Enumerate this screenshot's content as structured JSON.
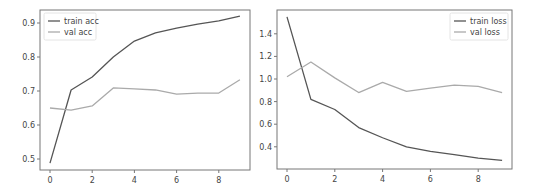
{
  "chart_data": [
    {
      "type": "line",
      "title": "",
      "xlabel": "",
      "ylabel": "",
      "x": [
        0,
        1,
        2,
        3,
        4,
        5,
        6,
        7,
        8,
        9
      ],
      "xticks": [
        "0",
        "2",
        "4",
        "6",
        "8"
      ],
      "yticks": [
        "0.5",
        "0.6",
        "0.7",
        "0.8",
        "0.9"
      ],
      "ylim": [
        0.47,
        0.94
      ],
      "grid": false,
      "legend_position": "upper left",
      "series": [
        {
          "name": "train acc",
          "color": "#555555",
          "values": [
            0.488,
            0.703,
            0.741,
            0.8,
            0.847,
            0.871,
            0.885,
            0.897,
            0.906,
            0.92
          ]
        },
        {
          "name": "val acc",
          "color": "#aaaaaa",
          "values": [
            0.65,
            0.644,
            0.656,
            0.709,
            0.706,
            0.703,
            0.691,
            0.694,
            0.694,
            0.733
          ]
        }
      ]
    },
    {
      "type": "line",
      "title": "",
      "xlabel": "",
      "ylabel": "",
      "x": [
        0,
        1,
        2,
        3,
        4,
        5,
        6,
        7,
        8,
        9
      ],
      "xticks": [
        "0",
        "2",
        "4",
        "6",
        "8"
      ],
      "yticks": [
        "0.4",
        "0.6",
        "0.8",
        "1.0",
        "1.2",
        "1.4"
      ],
      "ylim": [
        0.22,
        1.6
      ],
      "grid": false,
      "legend_position": "upper right",
      "series": [
        {
          "name": "train loss",
          "color": "#555555",
          "values": [
            1.55,
            0.82,
            0.73,
            0.57,
            0.48,
            0.4,
            0.36,
            0.33,
            0.3,
            0.28
          ]
        },
        {
          "name": "val loss",
          "color": "#aaaaaa",
          "values": [
            1.02,
            1.15,
            1.01,
            0.88,
            0.97,
            0.89,
            0.92,
            0.945,
            0.935,
            0.88
          ]
        }
      ]
    }
  ],
  "legends": {
    "accuracy": [
      "train acc",
      "val acc"
    ],
    "loss": [
      "train loss",
      "val loss"
    ]
  }
}
